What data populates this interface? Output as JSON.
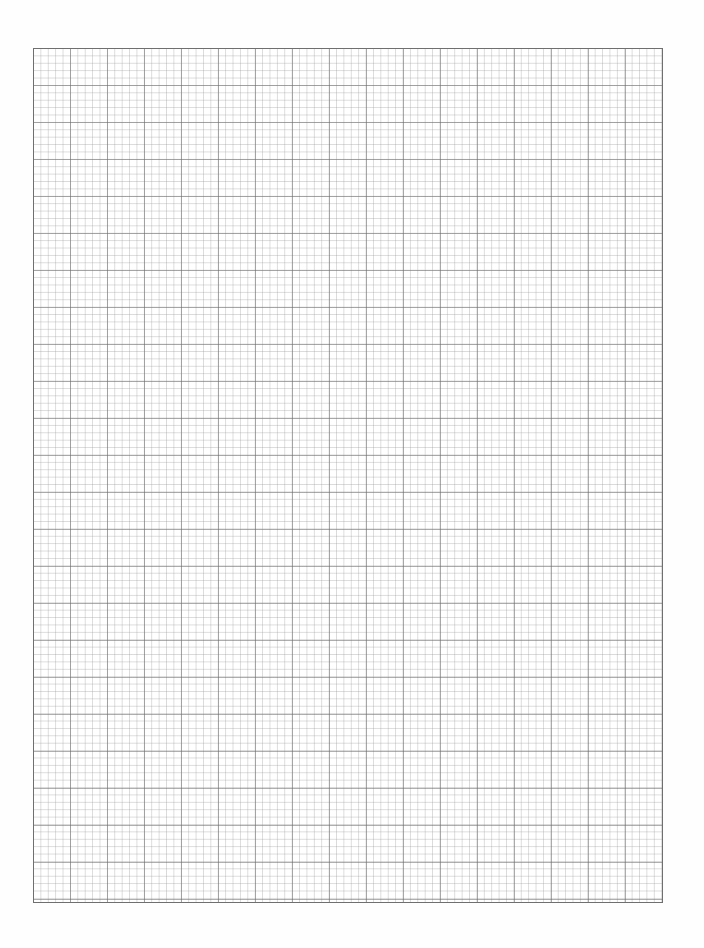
{
  "document": {
    "type": "graph-paper",
    "grid": {
      "left_px": 33,
      "top_px": 48,
      "width_px": 630,
      "height_px": 855,
      "minor_cell_px": 7.4,
      "major_every_cells": 5,
      "columns": 85,
      "rows": 115,
      "border_color": "#6f6f6f",
      "major_line_color": "#6e6e6e",
      "minor_line_color": "#969696"
    },
    "background_color": "#ffffff"
  }
}
